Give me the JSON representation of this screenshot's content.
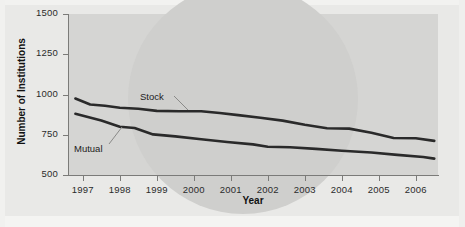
{
  "figure": {
    "axis_titles": {
      "y": "Number of Institutions",
      "x": "Year"
    },
    "colors": {
      "panel_background": "#d5d5d3",
      "figure_background": "#e9e9e7",
      "axis": "#7b7b79",
      "series_line": "#2a2a2a",
      "leader_line": "#8a8a88",
      "text": "#1d1d1d"
    }
  },
  "chart_data": {
    "type": "line",
    "title": "",
    "xlabel": "Year",
    "ylabel": "Number of Institutions",
    "categories": [
      1997,
      1998,
      1999,
      2000,
      2001,
      2002,
      2003,
      2004,
      2005,
      2006
    ],
    "x": [
      1997,
      1998,
      1999,
      2000,
      2001,
      2002,
      2003,
      2004,
      2005,
      2006
    ],
    "xlim": [
      1996.6,
      2006.6
    ],
    "ylim": [
      500,
      1500
    ],
    "yticks": [
      500,
      750,
      1000,
      1250,
      1500
    ],
    "ytick_labels": [
      "500",
      "750",
      "1000",
      "1250",
      "1500"
    ],
    "xtick_labels": [
      "1997",
      "1998",
      "1999",
      "2000",
      "2001",
      "2002",
      "2003",
      "2004",
      "2005",
      "2006"
    ],
    "grid": false,
    "legend": "inline-annotations",
    "series": [
      {
        "name": "Stock",
        "label_text": "Stock",
        "values": [
          975,
          930,
          912,
          898,
          895,
          878,
          840,
          800,
          775,
          712
        ],
        "points": [
          {
            "x": 1996.8,
            "y": 975
          },
          {
            "x": 1997.2,
            "y": 938
          },
          {
            "x": 1997.6,
            "y": 930
          },
          {
            "x": 1998.0,
            "y": 918
          },
          {
            "x": 1998.5,
            "y": 912
          },
          {
            "x": 1999.0,
            "y": 898
          },
          {
            "x": 1999.6,
            "y": 896
          },
          {
            "x": 2000.2,
            "y": 896
          },
          {
            "x": 2000.7,
            "y": 885
          },
          {
            "x": 2001.2,
            "y": 872
          },
          {
            "x": 2001.8,
            "y": 855
          },
          {
            "x": 2002.4,
            "y": 838
          },
          {
            "x": 2003.0,
            "y": 812
          },
          {
            "x": 2003.6,
            "y": 790
          },
          {
            "x": 2004.2,
            "y": 788
          },
          {
            "x": 2004.8,
            "y": 762
          },
          {
            "x": 2005.4,
            "y": 730
          },
          {
            "x": 2006.0,
            "y": 728
          },
          {
            "x": 2006.5,
            "y": 712
          }
        ]
      },
      {
        "name": "Mutual",
        "label_text": "Mutual",
        "values": [
          880,
          800,
          752,
          725,
          700,
          678,
          668,
          650,
          635,
          602
        ],
        "points": [
          {
            "x": 1996.8,
            "y": 880
          },
          {
            "x": 1997.5,
            "y": 838
          },
          {
            "x": 1998.0,
            "y": 800
          },
          {
            "x": 1998.4,
            "y": 792
          },
          {
            "x": 1998.9,
            "y": 752
          },
          {
            "x": 1999.5,
            "y": 740
          },
          {
            "x": 2000.2,
            "y": 722
          },
          {
            "x": 2000.9,
            "y": 705
          },
          {
            "x": 2001.6,
            "y": 690
          },
          {
            "x": 2002.0,
            "y": 676
          },
          {
            "x": 2002.6,
            "y": 672
          },
          {
            "x": 2003.3,
            "y": 662
          },
          {
            "x": 2004.0,
            "y": 650
          },
          {
            "x": 2004.8,
            "y": 640
          },
          {
            "x": 2005.5,
            "y": 625
          },
          {
            "x": 2006.2,
            "y": 612
          },
          {
            "x": 2006.5,
            "y": 602
          }
        ]
      }
    ],
    "annotations": [
      {
        "text": "Stock",
        "series": "Stock"
      },
      {
        "text": "Mutual",
        "series": "Mutual"
      }
    ]
  }
}
